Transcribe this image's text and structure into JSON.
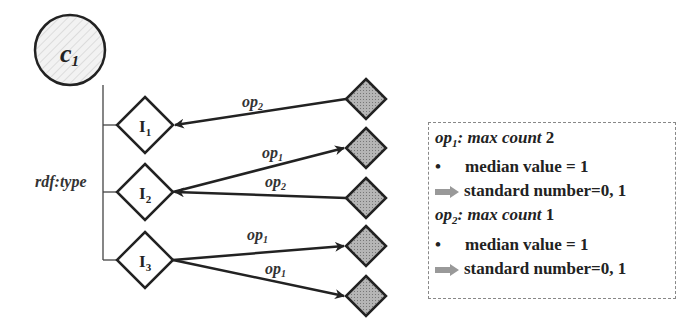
{
  "diagram": {
    "class_node": {
      "label": "c",
      "subscript": "1"
    },
    "relation_label": "rdf:type",
    "instances": [
      {
        "label": "I",
        "subscript": "1"
      },
      {
        "label": "I",
        "subscript": "2"
      },
      {
        "label": "I",
        "subscript": "3"
      }
    ],
    "edges": [
      {
        "from": "value-1",
        "to": "I1",
        "label": "op",
        "subscript": "2"
      },
      {
        "from": "I2",
        "to": "value-2",
        "label": "op",
        "subscript": "1"
      },
      {
        "from": "value-3",
        "to": "I2",
        "label": "op",
        "subscript": "2"
      },
      {
        "from": "I3",
        "to": "value-4",
        "label": "op",
        "subscript": "1"
      },
      {
        "from": "I3",
        "to": "value-5",
        "label": "op",
        "subscript": "1"
      }
    ],
    "colors": {
      "value_fill": "#a9a9a9",
      "stroke": "#222222",
      "class_fill": "#eeeeee"
    }
  },
  "legend": {
    "sections": [
      {
        "prop": "op",
        "sub": "1",
        "head_rest": ": max count",
        "count": "2",
        "median": "median value = 1",
        "standard": "standard number=0, 1"
      },
      {
        "prop": "op",
        "sub": "2",
        "head_rest": ": max count",
        "count": "1",
        "median": "median value = 1",
        "standard": "standard number=0, 1"
      }
    ],
    "bullet": "•"
  }
}
